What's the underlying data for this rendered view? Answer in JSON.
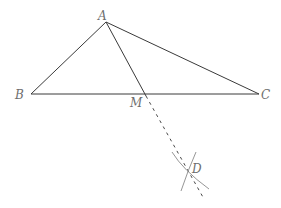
{
  "diagram": {
    "points": {
      "A": {
        "label": "A",
        "x": 106,
        "y": 22
      },
      "B": {
        "label": "B",
        "x": 31,
        "y": 94
      },
      "C": {
        "label": "C",
        "x": 259,
        "y": 94
      },
      "M": {
        "label": "M",
        "x": 145,
        "y": 94
      },
      "D": {
        "label": "D",
        "x": 188,
        "y": 170
      }
    },
    "segments": [
      {
        "from": "A",
        "to": "B",
        "style": "solid"
      },
      {
        "from": "A",
        "to": "C",
        "style": "solid"
      },
      {
        "from": "B",
        "to": "C",
        "style": "solid"
      },
      {
        "from": "A",
        "to": "M",
        "style": "solid"
      },
      {
        "from": "M",
        "to": "D",
        "style": "dashed",
        "extends_beyond": true
      }
    ],
    "arcs": [
      {
        "name": "construction-arc-1"
      },
      {
        "name": "construction-arc-2"
      }
    ],
    "colors": {
      "line": "#3a3a3a",
      "construction": "#8a8a8a",
      "label": "#6e6e6e"
    }
  }
}
